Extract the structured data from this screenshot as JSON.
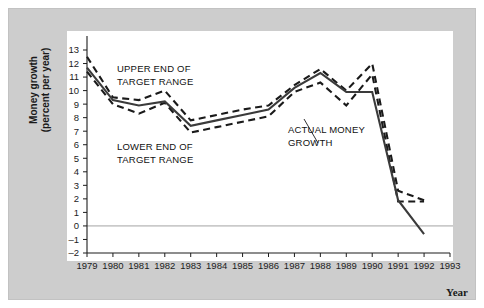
{
  "figure": {
    "background_color": "#cdcdcd",
    "plot_background_color": "#ffffff"
  },
  "axis": {
    "y_title_line1": "Money growth",
    "y_title_line2": "(percent per year)",
    "x_title": "Year"
  },
  "annotations": {
    "upper_label_line1": "UPPER END OF",
    "upper_label_line2": "TARGET RANGE",
    "lower_label_line1": "LOWER END OF",
    "lower_label_line2": "TARGET RANGE",
    "actual_label_line1": "ACTUAL MONEY",
    "actual_label_line2": "GROWTH"
  },
  "chart_data": {
    "type": "line",
    "title": "",
    "subtitle": "",
    "xlabel": "Year",
    "ylabel": "Money growth (percent per year)",
    "xlim": [
      1979,
      1993
    ],
    "ylim": [
      -2,
      13
    ],
    "grid": false,
    "legend": "inline-annotations",
    "x": [
      1979,
      1980,
      1981,
      1982,
      1983,
      1984,
      1985,
      1986,
      1987,
      1988,
      1989,
      1990,
      1991,
      1992
    ],
    "xtick_labels": [
      "1979",
      "1980",
      "1981",
      "1982",
      "1983",
      "1984",
      "1985",
      "1986",
      "1987",
      "1988",
      "1989",
      "1990",
      "1991",
      "1992",
      "1993"
    ],
    "ytick_labels": [
      "13",
      "12",
      "11",
      "10",
      "9",
      "8",
      "7",
      "6",
      "5",
      "4",
      "3",
      "2",
      "1",
      "0",
      "-1",
      "-2"
    ],
    "ytick_values": [
      13,
      12,
      11,
      10,
      9,
      8,
      7,
      6,
      5,
      4,
      3,
      2,
      1,
      0,
      -1,
      -2
    ],
    "series": [
      {
        "name": "ACTUAL MONEY GROWTH",
        "style": "solid",
        "color": "#3b3b3b",
        "values": [
          11.7,
          9.3,
          8.9,
          9.2,
          7.4,
          7.8,
          8.2,
          8.6,
          10.2,
          11.3,
          9.9,
          9.9,
          1.9,
          -0.6
        ]
      },
      {
        "name": "UPPER END OF TARGET RANGE",
        "style": "dashed",
        "color": "#1a1a1a",
        "values": [
          12.5,
          9.5,
          9.3,
          10.0,
          7.8,
          8.2,
          8.6,
          8.9,
          10.4,
          11.6,
          10.0,
          12.0,
          2.6,
          1.9
        ]
      },
      {
        "name": "LOWER END OF TARGET RANGE",
        "style": "dashed",
        "color": "#1a1a1a",
        "values": [
          11.4,
          9.0,
          8.3,
          9.1,
          6.9,
          7.3,
          7.7,
          8.1,
          9.9,
          10.6,
          8.9,
          11.2,
          1.8,
          1.8
        ]
      }
    ]
  }
}
